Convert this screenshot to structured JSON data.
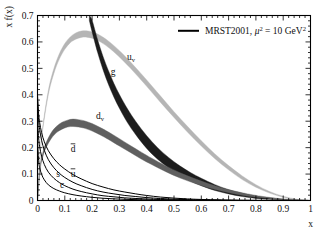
{
  "figure": {
    "background": "#ffffff",
    "frame_color": "#000000"
  },
  "axes": {
    "x": {
      "label": "x",
      "min": 0,
      "max": 1,
      "ticks": [
        "0",
        "0.1",
        "0.2",
        "0.3",
        "0.4",
        "0.5",
        "0.6",
        "0.7",
        "0.8",
        "0.9",
        "1"
      ],
      "tick_values": [
        0,
        0.1,
        0.2,
        0.3,
        0.4,
        0.5,
        0.6,
        0.7,
        0.8,
        0.9,
        1.0
      ]
    },
    "y": {
      "label": "x f(x)",
      "min": 0,
      "max": 0.7,
      "ticks": [
        "0",
        "0.1",
        "0.2",
        "0.3",
        "0.4",
        "0.5",
        "0.6",
        "0.7"
      ],
      "tick_values": [
        0,
        0.1,
        0.2,
        0.3,
        0.4,
        0.5,
        0.6,
        0.7
      ]
    }
  },
  "legend": {
    "position": "top-right",
    "swatch_color": "#000000",
    "text_main": "MRST2001, ",
    "mu_symbol": "μ",
    "mu_exponent": "2",
    "equals_value": " = 10 GeV",
    "gev_exponent": "2"
  },
  "curve_labels": [
    {
      "name": "u-valence",
      "base": "u",
      "sub": "v",
      "x_px": 131,
      "y_px": 60
    },
    {
      "name": "gluon",
      "base": "g",
      "sub": "",
      "x_px": 113,
      "y_px": 75
    },
    {
      "name": "d-valence",
      "base": "d",
      "sub": "v",
      "x_px": 100,
      "y_px": 119
    },
    {
      "name": "d-bar",
      "base": "d",
      "sub": "",
      "overbar": true,
      "x_px": 73,
      "y_px": 152
    },
    {
      "name": "u-bar",
      "base": "u",
      "sub": "",
      "overbar": true,
      "x_px": 73,
      "y_px": 177
    },
    {
      "name": "strange",
      "base": "s",
      "sub": "",
      "x_px": 58,
      "y_px": 177
    },
    {
      "name": "charm",
      "base": "c",
      "sub": "",
      "x_px": 62,
      "y_px": 188
    }
  ],
  "chart_data": {
    "type": "line",
    "title": "",
    "subtitle": "",
    "xlabel": "x",
    "ylabel": "x f(x)",
    "xlim": [
      0,
      1
    ],
    "ylim": [
      0,
      0.7
    ],
    "grid": false,
    "legend_position": "top-right",
    "legend_entries": [
      "MRST2001, μ² = 10 GeV²"
    ],
    "annotations": [
      "u_v",
      "g",
      "d_v",
      "dbar",
      "ubar",
      "s",
      "c"
    ],
    "series": [
      {
        "name": "u_v",
        "display": "u valence quark",
        "style": "band",
        "color": "#b5b5b5",
        "x": [
          0.0,
          0.01,
          0.02,
          0.04,
          0.06,
          0.08,
          0.1,
          0.12,
          0.14,
          0.16,
          0.18,
          0.2,
          0.22,
          0.25,
          0.28,
          0.31,
          0.34,
          0.37,
          0.4,
          0.45,
          0.5,
          0.55,
          0.6,
          0.65,
          0.7,
          0.75,
          0.8,
          0.85,
          0.9,
          0.95,
          1.0
        ],
        "values": [
          0.0,
          0.18,
          0.28,
          0.41,
          0.49,
          0.545,
          0.583,
          0.608,
          0.622,
          0.629,
          0.63,
          0.626,
          0.618,
          0.599,
          0.574,
          0.545,
          0.513,
          0.479,
          0.444,
          0.384,
          0.325,
          0.269,
          0.216,
          0.167,
          0.124,
          0.086,
          0.055,
          0.031,
          0.014,
          0.004,
          0.0
        ],
        "band_width": [
          0.0,
          0.004,
          0.006,
          0.008,
          0.009,
          0.01,
          0.011,
          0.011,
          0.012,
          0.012,
          0.012,
          0.012,
          0.012,
          0.012,
          0.012,
          0.012,
          0.012,
          0.012,
          0.012,
          0.012,
          0.011,
          0.011,
          0.01,
          0.009,
          0.008,
          0.007,
          0.005,
          0.003,
          0.002,
          0.001,
          0.0
        ]
      },
      {
        "name": "g",
        "display": "gluon",
        "style": "band",
        "color": "#1c1c1c",
        "x": [
          0.19,
          0.2,
          0.22,
          0.24,
          0.26,
          0.28,
          0.3,
          0.33,
          0.36,
          0.4,
          0.44,
          0.48,
          0.52,
          0.56,
          0.6,
          0.65,
          0.7,
          0.75,
          0.8,
          0.85,
          0.9,
          0.95,
          1.0
        ],
        "values": [
          0.7,
          0.66,
          0.585,
          0.52,
          0.465,
          0.417,
          0.375,
          0.32,
          0.274,
          0.221,
          0.178,
          0.143,
          0.114,
          0.09,
          0.07,
          0.049,
          0.033,
          0.021,
          0.012,
          0.0065,
          0.003,
          0.0008,
          0.0
        ],
        "band_width": [
          0.02,
          0.022,
          0.024,
          0.025,
          0.026,
          0.026,
          0.026,
          0.026,
          0.025,
          0.024,
          0.022,
          0.02,
          0.018,
          0.016,
          0.014,
          0.011,
          0.008,
          0.006,
          0.004,
          0.002,
          0.001,
          0.0004,
          0.0
        ]
      },
      {
        "name": "d_v",
        "display": "d valence quark",
        "style": "band",
        "color": "#5f5f5f",
        "x": [
          0.0,
          0.01,
          0.02,
          0.03,
          0.05,
          0.07,
          0.09,
          0.11,
          0.13,
          0.15,
          0.17,
          0.2,
          0.23,
          0.26,
          0.3,
          0.34,
          0.38,
          0.42,
          0.47,
          0.52,
          0.57,
          0.62,
          0.67,
          0.72,
          0.78,
          0.84,
          0.9,
          0.95,
          1.0
        ],
        "values": [
          0.0,
          0.125,
          0.175,
          0.206,
          0.245,
          0.269,
          0.283,
          0.291,
          0.294,
          0.292,
          0.288,
          0.277,
          0.262,
          0.245,
          0.22,
          0.195,
          0.17,
          0.147,
          0.12,
          0.096,
          0.076,
          0.058,
          0.043,
          0.031,
          0.019,
          0.011,
          0.005,
          0.002,
          0.0
        ],
        "band_width": [
          0.0,
          0.006,
          0.008,
          0.009,
          0.011,
          0.012,
          0.013,
          0.013,
          0.014,
          0.014,
          0.014,
          0.014,
          0.014,
          0.014,
          0.014,
          0.013,
          0.013,
          0.012,
          0.011,
          0.01,
          0.009,
          0.008,
          0.006,
          0.005,
          0.004,
          0.002,
          0.001,
          0.0005,
          0.0
        ]
      },
      {
        "name": "dbar",
        "display": "anti-down sea quark",
        "style": "line",
        "color": "#000000",
        "x": [
          0.0,
          0.004,
          0.008,
          0.015,
          0.025,
          0.04,
          0.06,
          0.08,
          0.1,
          0.13,
          0.16,
          0.2,
          0.24,
          0.28,
          0.32,
          0.36,
          0.4,
          0.45,
          0.5,
          0.55,
          0.6,
          0.7,
          0.8,
          1.0
        ],
        "values": [
          0.4,
          0.33,
          0.295,
          0.257,
          0.222,
          0.188,
          0.158,
          0.136,
          0.119,
          0.098,
          0.082,
          0.064,
          0.051,
          0.04,
          0.032,
          0.025,
          0.019,
          0.013,
          0.009,
          0.006,
          0.004,
          0.0015,
          0.0004,
          0.0
        ]
      },
      {
        "name": "ubar",
        "display": "anti-up sea quark",
        "style": "line",
        "color": "#000000",
        "x": [
          0.0,
          0.004,
          0.008,
          0.015,
          0.025,
          0.04,
          0.06,
          0.08,
          0.1,
          0.13,
          0.16,
          0.2,
          0.24,
          0.28,
          0.32,
          0.36,
          0.4,
          0.45,
          0.5,
          0.55,
          0.6,
          0.7,
          0.8,
          1.0
        ],
        "values": [
          0.38,
          0.305,
          0.268,
          0.228,
          0.19,
          0.154,
          0.124,
          0.103,
          0.087,
          0.069,
          0.056,
          0.042,
          0.032,
          0.025,
          0.019,
          0.015,
          0.011,
          0.0075,
          0.005,
          0.0033,
          0.0021,
          0.0008,
          0.0002,
          0.0
        ]
      },
      {
        "name": "s",
        "display": "strange sea quark",
        "style": "line",
        "color": "#000000",
        "x": [
          0.0,
          0.004,
          0.008,
          0.015,
          0.025,
          0.04,
          0.06,
          0.08,
          0.1,
          0.13,
          0.16,
          0.2,
          0.24,
          0.28,
          0.32,
          0.36,
          0.4,
          0.45,
          0.5,
          0.55,
          0.6,
          0.7,
          0.8,
          1.0
        ],
        "values": [
          0.31,
          0.238,
          0.203,
          0.168,
          0.136,
          0.107,
          0.084,
          0.068,
          0.056,
          0.043,
          0.034,
          0.025,
          0.018,
          0.014,
          0.01,
          0.0077,
          0.0057,
          0.0037,
          0.0024,
          0.0015,
          0.0009,
          0.0003,
          0.0001,
          0.0
        ]
      },
      {
        "name": "c",
        "display": "charm sea quark",
        "style": "line",
        "color": "#000000",
        "x": [
          0.0,
          0.004,
          0.008,
          0.015,
          0.025,
          0.04,
          0.06,
          0.08,
          0.1,
          0.13,
          0.16,
          0.2,
          0.24,
          0.28,
          0.32,
          0.36,
          0.4,
          0.45,
          0.5,
          0.55,
          0.6,
          0.7,
          0.8,
          1.0
        ],
        "values": [
          0.23,
          0.152,
          0.124,
          0.099,
          0.078,
          0.059,
          0.045,
          0.036,
          0.029,
          0.022,
          0.017,
          0.012,
          0.0085,
          0.0062,
          0.0045,
          0.0033,
          0.0024,
          0.0015,
          0.0009,
          0.0006,
          0.0003,
          0.0001,
          3e-05,
          0.0
        ]
      }
    ]
  }
}
